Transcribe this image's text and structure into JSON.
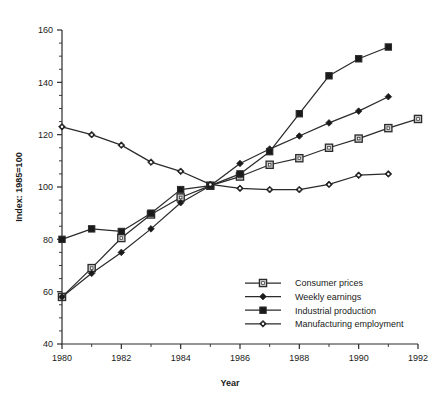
{
  "chart_data": {
    "type": "line",
    "title": "",
    "xlabel": "Year",
    "ylabel": "Index: 1985=100",
    "xlim": [
      1980,
      1992
    ],
    "ylim": [
      40,
      160
    ],
    "y_ticks": [
      40,
      60,
      80,
      100,
      120,
      140,
      160
    ],
    "x_ticks": [
      1980,
      1982,
      1984,
      1986,
      1988,
      1990,
      1992
    ],
    "x_minor_ticks": [
      1981,
      1983,
      1985,
      1987,
      1989,
      1991
    ],
    "y_minor_step": 5,
    "grid": false,
    "legend_position": "lower-right",
    "series": [
      {
        "name": "Consumer prices",
        "marker": "open-square",
        "x": [
          1980,
          1981,
          1982,
          1983,
          1984,
          1985,
          1986,
          1987,
          1988,
          1989,
          1990,
          1991,
          1992
        ],
        "values": [
          58,
          69,
          80.5,
          89.5,
          96,
          100.5,
          104,
          108.5,
          111,
          115,
          118.5,
          122.5,
          126
        ]
      },
      {
        "name": "Weekly earnings",
        "marker": "filled-diamond",
        "x": [
          1980,
          1981,
          1982,
          1983,
          1984,
          1985,
          1986,
          1987,
          1988,
          1989,
          1990,
          1991
        ],
        "values": [
          58,
          67,
          75,
          84,
          94,
          100.5,
          109,
          114.5,
          119.5,
          124.5,
          129,
          134.5
        ]
      },
      {
        "name": "Industrial production",
        "marker": "filled-square",
        "x": [
          1980,
          1981,
          1982,
          1983,
          1984,
          1985,
          1986,
          1987,
          1988,
          1989,
          1990,
          1991
        ],
        "values": [
          80,
          84,
          83,
          90,
          99,
          100.5,
          105,
          113.5,
          128,
          142.5,
          149,
          153.5
        ]
      },
      {
        "name": "Manufacturing employment",
        "marker": "open-diamond",
        "x": [
          1980,
          1981,
          1982,
          1983,
          1984,
          1985,
          1986,
          1987,
          1988,
          1989,
          1990,
          1991
        ],
        "values": [
          123,
          120,
          116,
          109.5,
          106,
          101,
          99.5,
          99,
          99,
          101,
          104.5,
          105
        ]
      }
    ]
  },
  "axes": {
    "y_label": "Index: 1985=100",
    "x_label": "Year",
    "y_tick_labels": [
      "40",
      "60",
      "80",
      "100",
      "120",
      "140",
      "160"
    ],
    "x_tick_labels": [
      "1980",
      "1982",
      "1984",
      "1986",
      "1988",
      "1990",
      "1992"
    ]
  },
  "legend": {
    "entries": [
      {
        "label": "Consumer prices",
        "marker": "open-square-icon"
      },
      {
        "label": "Weekly earnings",
        "marker": "filled-diamond-icon"
      },
      {
        "label": "Industrial production",
        "marker": "filled-square-icon"
      },
      {
        "label": "Manufacturing employment",
        "marker": "open-diamond-icon"
      }
    ]
  },
  "colors": {
    "ink": "#2b2b2b",
    "open_marker_fill": "#c8c8c8",
    "filled_marker_fill": "#1a1a1a",
    "background": "#ffffff"
  }
}
